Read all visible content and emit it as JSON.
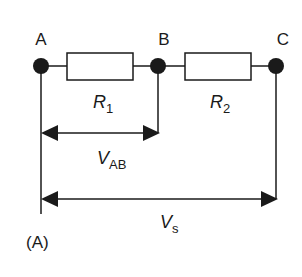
{
  "diagram": {
    "nodes": [
      {
        "id": "A",
        "label": "A"
      },
      {
        "id": "B",
        "label": "B"
      },
      {
        "id": "C",
        "label": "C"
      }
    ],
    "resistors": [
      {
        "id": "R1",
        "symbol": "R",
        "subscript": "1",
        "between": [
          "A",
          "B"
        ]
      },
      {
        "id": "R2",
        "symbol": "R",
        "subscript": "2",
        "between": [
          "B",
          "C"
        ]
      }
    ],
    "voltages": [
      {
        "id": "VAB",
        "symbol": "V",
        "subscript": "AB",
        "between": [
          "A",
          "B"
        ]
      },
      {
        "id": "Vs",
        "symbol": "V",
        "subscript": "s",
        "between": [
          "A",
          "C"
        ]
      }
    ],
    "panel_label": "(A)",
    "colors": {
      "line": "#1a1a1a",
      "fill": "#ffffff"
    }
  }
}
